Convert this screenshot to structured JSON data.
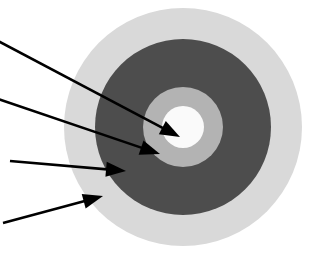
{
  "figure": {
    "title": "Concentric zone diagram",
    "background_color": "#ffffff",
    "width": 312,
    "height": 259
  },
  "diagram_data": {
    "type": "concentric-circles",
    "center": {
      "x": 183,
      "y": 127
    },
    "zones": [
      {
        "name": "outer-zone",
        "label": "",
        "shape": "circle",
        "radius": 119,
        "color": "#d9d9d9",
        "order": 1
      },
      {
        "name": "second-zone",
        "label": "",
        "shape": "circle",
        "radius": 88,
        "color": "#4d4d4d",
        "order": 2
      },
      {
        "name": "third-zone",
        "label": "",
        "shape": "circle",
        "radius": 40,
        "color": "#b3b3b3",
        "order": 3
      },
      {
        "name": "core-zone",
        "label": "",
        "shape": "circle",
        "radius": 21,
        "color": "#fafafa",
        "order": 4
      }
    ],
    "callouts": [
      {
        "name": "callout-core",
        "label": "",
        "target_zone": "core-zone",
        "tail": {
          "x": -2,
          "y": 41
        },
        "tip": {
          "x": 180,
          "y": 137
        },
        "color": "#000000"
      },
      {
        "name": "callout-third",
        "label": "",
        "target_zone": "third-zone",
        "tail": {
          "x": -2,
          "y": 99
        },
        "tip": {
          "x": 160,
          "y": 154
        },
        "color": "#000000"
      },
      {
        "name": "callout-second",
        "label": "",
        "target_zone": "second-zone",
        "tail": {
          "x": 10,
          "y": 161
        },
        "tip": {
          "x": 126,
          "y": 171
        },
        "color": "#000000"
      },
      {
        "name": "callout-outer",
        "label": "",
        "target_zone": "outer-zone",
        "tail": {
          "x": 3,
          "y": 223
        },
        "tip": {
          "x": 103,
          "y": 196
        },
        "color": "#000000"
      }
    ]
  }
}
